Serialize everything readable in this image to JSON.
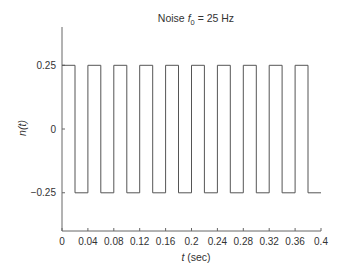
{
  "chart_data": {
    "type": "line",
    "title": "Noise f0 = 25 Hz",
    "title_parts": {
      "prefix": "Noise ",
      "var": "f",
      "sub": "0",
      "suffix": " = 25 Hz"
    },
    "xlabel": "t (sec)",
    "xlabel_parts": {
      "var": "t",
      "rest": " (sec)"
    },
    "ylabel": "n(t)",
    "xlim": [
      0,
      0.4
    ],
    "ylim": [
      -0.4,
      0.4
    ],
    "grid": false,
    "legend": null,
    "xticks": [
      0,
      0.04,
      0.08,
      0.12,
      0.16,
      0.2,
      0.24,
      0.28,
      0.32,
      0.36,
      0.4
    ],
    "xtick_labels": [
      "0",
      "0.04",
      "0.08",
      "0.12",
      "0.16",
      "0.2",
      "0.24",
      "0.28",
      "0.32",
      "0.36",
      "0.4"
    ],
    "yticks": [
      0.25,
      0,
      -0.25
    ],
    "ytick_labels": [
      "0.25",
      "0",
      "−0.25"
    ],
    "series": [
      {
        "name": "n(t)",
        "style": "step",
        "description": "Square wave, amplitude ±0.25, frequency 25 Hz (period 0.04 s), 50% duty cycle",
        "x": [
          0,
          0.02,
          0.02,
          0.04,
          0.04,
          0.06,
          0.06,
          0.08,
          0.08,
          0.1,
          0.1,
          0.12,
          0.12,
          0.14,
          0.14,
          0.16,
          0.16,
          0.18,
          0.18,
          0.2,
          0.2,
          0.22,
          0.22,
          0.24,
          0.24,
          0.26,
          0.26,
          0.28,
          0.28,
          0.3,
          0.3,
          0.32,
          0.32,
          0.34,
          0.34,
          0.36,
          0.36,
          0.38,
          0.38,
          0.4
        ],
        "y": [
          0.25,
          0.25,
          -0.25,
          -0.25,
          0.25,
          0.25,
          -0.25,
          -0.25,
          0.25,
          0.25,
          -0.25,
          -0.25,
          0.25,
          0.25,
          -0.25,
          -0.25,
          0.25,
          0.25,
          -0.25,
          -0.25,
          0.25,
          0.25,
          -0.25,
          -0.25,
          0.25,
          0.25,
          -0.25,
          -0.25,
          0.25,
          0.25,
          -0.25,
          -0.25,
          0.25,
          0.25,
          -0.25,
          -0.25,
          0.25,
          0.25,
          -0.25,
          -0.25
        ],
        "color": "#555555"
      }
    ]
  },
  "colors": {
    "axis": "#666666",
    "line": "#555555",
    "text": "#333333"
  }
}
